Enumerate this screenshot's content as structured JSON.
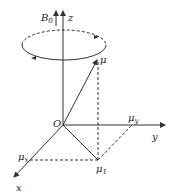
{
  "diagram": {
    "type": "vector-precession",
    "labels": {
      "B0": "B",
      "B0_sub": "0",
      "z": "z",
      "mu": "μ",
      "origin": "O",
      "y": "y",
      "x": "x",
      "mu_x": "μ",
      "mu_x_sub": "x",
      "mu_y": "μ",
      "mu_y_sub": "y",
      "mu_1": "μ",
      "mu_1_sub": "1"
    },
    "colors": {
      "stroke": "#333333",
      "background": "#ffffff"
    }
  }
}
